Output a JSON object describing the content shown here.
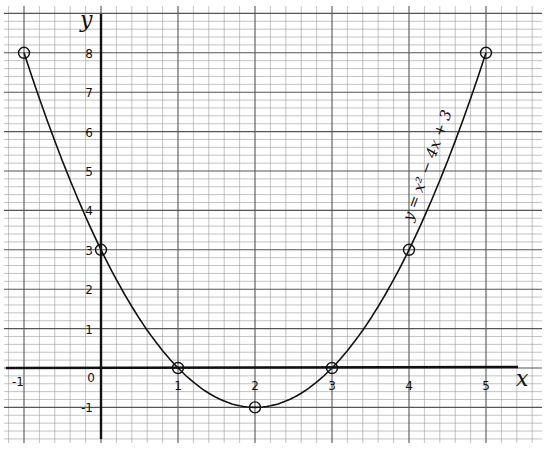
{
  "chart_data": {
    "type": "line",
    "title": "",
    "xlabel": "x",
    "ylabel": "y",
    "xlim": [
      -1.1,
      5.5
    ],
    "ylim": [
      -1.9,
      8.6
    ],
    "grid": true,
    "grid_major_step": 1,
    "grid_minor_step": 0.2,
    "x_ticks": [
      "-1",
      "0",
      "1",
      "2",
      "3",
      "4",
      "5"
    ],
    "y_ticks": [
      "-1",
      "1",
      "2",
      "3",
      "4",
      "5",
      "6",
      "7",
      "8"
    ],
    "annotation": "y = x² − 4x + 3",
    "series": [
      {
        "name": "y = x² − 4x + 3",
        "function": "x^2 - 4x + 3",
        "x": [
          -1,
          0,
          1,
          2,
          3,
          4,
          5
        ],
        "y": [
          8,
          3,
          0,
          -1,
          0,
          3,
          8
        ],
        "marker": "circle"
      }
    ],
    "legend": "none"
  },
  "labels": {
    "x_axis": "x",
    "y_axis": "y",
    "equation": "y = x² − 4x + 3",
    "origin": "0"
  }
}
